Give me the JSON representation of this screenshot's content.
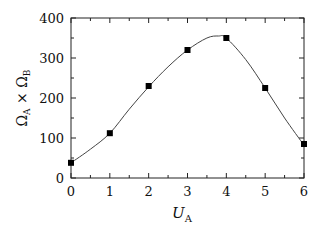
{
  "chart_data": {
    "type": "line",
    "title": "",
    "xlabel": "U_A",
    "ylabel": "Ω_A × Ω_B",
    "xlim": [
      0,
      6
    ],
    "ylim": [
      0,
      400
    ],
    "x_ticks": [
      "0",
      "1",
      "2",
      "3",
      "4",
      "5",
      "6"
    ],
    "y_ticks": [
      "0",
      "100",
      "200",
      "300",
      "400"
    ],
    "grid": false,
    "legend": null,
    "series": [
      {
        "name": "data",
        "marker": "square",
        "x": [
          0,
          1,
          2,
          3,
          4,
          5,
          6
        ],
        "values": [
          38,
          112,
          230,
          320,
          350,
          225,
          85
        ]
      },
      {
        "name": "fit",
        "style": "smooth-line",
        "x": [
          0,
          0.5,
          1,
          1.5,
          2,
          2.5,
          3,
          3.5,
          3.8,
          4,
          4.5,
          5,
          5.5,
          6
        ],
        "values": [
          38,
          72,
          112,
          172,
          228,
          278,
          320,
          350,
          355,
          350,
          296,
          225,
          150,
          82
        ]
      }
    ]
  }
}
